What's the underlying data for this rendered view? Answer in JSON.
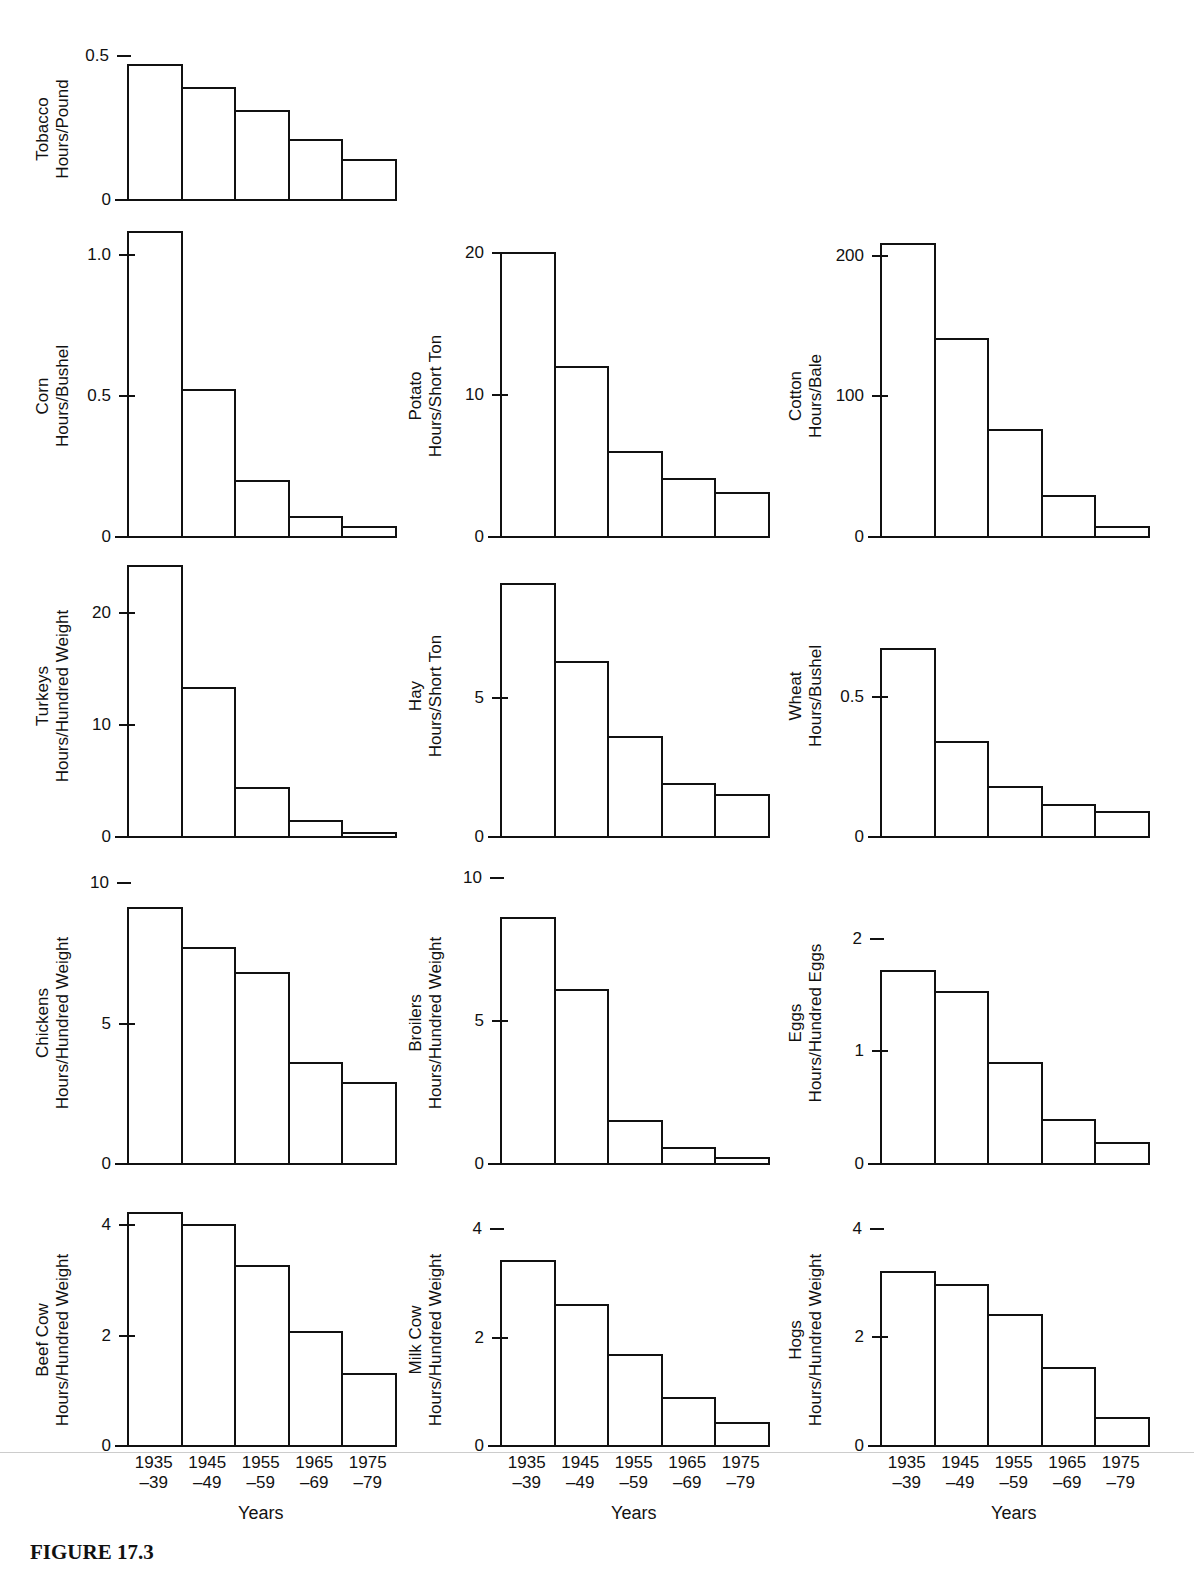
{
  "figure": {
    "caption": "FIGURE 17.3",
    "x_axis_title": "Years"
  },
  "categories": [
    "1935\n–39",
    "1945\n–49",
    "1955\n–59",
    "1965\n–69",
    "1975\n–79"
  ],
  "category_lines": [
    [
      "1935",
      "–39"
    ],
    [
      "1945",
      "–49"
    ],
    [
      "1955",
      "–59"
    ],
    [
      "1965",
      "–69"
    ],
    [
      "1975",
      "–79"
    ]
  ],
  "chart_data": [
    {
      "type": "bar",
      "title": "Tobacco",
      "ylabel": "Tobacco Hours/Pound",
      "xlabel": "",
      "categories": [
        "1935–39",
        "1945–49",
        "1955–59",
        "1965–69",
        "1975–79"
      ],
      "values": [
        0.47,
        0.39,
        0.31,
        0.21,
        0.14
      ],
      "yticks": [
        "0",
        "0.5"
      ],
      "ylim": [
        0,
        0.5
      ]
    },
    {
      "type": "bar",
      "title": "Corn",
      "ylabel": "Corn Hours/Bushel",
      "xlabel": "",
      "categories": [
        "1935–39",
        "1945–49",
        "1955–59",
        "1965–69",
        "1975–79"
      ],
      "values": [
        1.08,
        0.52,
        0.2,
        0.07,
        0.035
      ],
      "yticks": [
        "0",
        "0.5",
        "1.0"
      ],
      "ylim": [
        0,
        1.1
      ]
    },
    {
      "type": "bar",
      "title": "Potato",
      "ylabel": "Potato Hours/Short Ton",
      "xlabel": "",
      "categories": [
        "1935–39",
        "1945–49",
        "1955–59",
        "1965–69",
        "1975–79"
      ],
      "values": [
        20,
        12,
        6,
        4.1,
        3.1
      ],
      "yticks": [
        "0",
        "10",
        "20"
      ],
      "ylim": [
        0,
        20
      ]
    },
    {
      "type": "bar",
      "title": "Cotton",
      "ylabel": "Cotton Hours/Bale",
      "xlabel": "",
      "categories": [
        "1935–39",
        "1945–49",
        "1955–59",
        "1965–69",
        "1975–79"
      ],
      "values": [
        208,
        141,
        76,
        29,
        7
      ],
      "yticks": [
        "0",
        "100",
        "200"
      ],
      "ylim": [
        0,
        210
      ]
    },
    {
      "type": "bar",
      "title": "Turkeys",
      "ylabel": "Turkeys Hours/Hundred Weight",
      "xlabel": "",
      "categories": [
        "1935–39",
        "1945–49",
        "1955–59",
        "1965–69",
        "1975–79"
      ],
      "values": [
        24.2,
        13.3,
        4.4,
        1.4,
        0.4
      ],
      "yticks": [
        "0",
        "10",
        "20"
      ],
      "ylim": [
        0,
        24.5
      ]
    },
    {
      "type": "bar",
      "title": "Hay",
      "ylabel": "Hay Hours/Short Ton",
      "xlabel": "",
      "categories": [
        "1935–39",
        "1945–49",
        "1955–59",
        "1965–69",
        "1975–79"
      ],
      "values": [
        9.1,
        6.3,
        3.6,
        1.9,
        1.5
      ],
      "yticks": [
        "0",
        "5"
      ],
      "ylim": [
        0,
        9.2
      ]
    },
    {
      "type": "bar",
      "title": "Wheat",
      "ylabel": "Wheat Hours/Bushel",
      "xlabel": "",
      "categories": [
        "1935–39",
        "1945–49",
        "1955–59",
        "1965–69",
        "1975–79"
      ],
      "values": [
        0.67,
        0.34,
        0.18,
        0.115,
        0.09
      ],
      "yticks": [
        "0",
        "0.5"
      ],
      "ylim": [
        0,
        0.7
      ]
    },
    {
      "type": "bar",
      "title": "Chickens",
      "ylabel": "Chickens Hours/Hundred Weight",
      "xlabel": "",
      "categories": [
        "1935–39",
        "1945–49",
        "1955–59",
        "1965–69",
        "1975–79"
      ],
      "values": [
        9.1,
        7.7,
        6.8,
        3.6,
        2.9
      ],
      "yticks": [
        "0",
        "5",
        "10"
      ],
      "ylim": [
        0,
        10
      ]
    },
    {
      "type": "bar",
      "title": "Broilers",
      "ylabel": "Broilers Hours/Hundred Weight",
      "xlabel": "",
      "categories": [
        "1935–39",
        "1945–49",
        "1955–59",
        "1965–69",
        "1975–79"
      ],
      "values": [
        8.6,
        6.1,
        1.5,
        0.55,
        0.22
      ],
      "yticks": [
        "0",
        "5",
        "10"
      ],
      "ylim": [
        0,
        10
      ]
    },
    {
      "type": "bar",
      "title": "Eggs",
      "ylabel": "Eggs Hours/Hundred Eggs",
      "xlabel": "",
      "categories": [
        "1935–39",
        "1945–49",
        "1955–59",
        "1965–69",
        "1975–79"
      ],
      "values": [
        1.71,
        1.53,
        0.9,
        0.39,
        0.19
      ],
      "yticks": [
        "0",
        "1",
        "2"
      ],
      "ylim": [
        0,
        2
      ]
    },
    {
      "type": "bar",
      "title": "Beef Cow",
      "ylabel": "Beef Cow Hours/Hundred Weight",
      "xlabel": "Years",
      "categories": [
        "1935–39",
        "1945–49",
        "1955–59",
        "1965–69",
        "1975–79"
      ],
      "values": [
        4.23,
        4.0,
        3.26,
        2.07,
        1.31
      ],
      "yticks": [
        "0",
        "2",
        "4"
      ],
      "ylim": [
        0,
        4.3
      ]
    },
    {
      "type": "bar",
      "title": "Milk Cow",
      "ylabel": "Milk Cow Hours/Hundred Weight",
      "xlabel": "Years",
      "categories": [
        "1935–39",
        "1945–49",
        "1955–59",
        "1965–69",
        "1975–79"
      ],
      "values": [
        3.41,
        2.6,
        1.67,
        0.89,
        0.42
      ],
      "yticks": [
        "0",
        "2",
        "4"
      ],
      "ylim": [
        0,
        4
      ]
    },
    {
      "type": "bar",
      "title": "Hogs",
      "ylabel": "Hogs Hours/Hundred Weight",
      "xlabel": "Years",
      "categories": [
        "1935–39",
        "1945–49",
        "1955–59",
        "1965–69",
        "1975–79"
      ],
      "values": [
        3.21,
        2.97,
        2.42,
        1.43,
        0.52
      ],
      "yticks": [
        "0",
        "2",
        "4"
      ],
      "ylim": [
        0,
        4
      ]
    }
  ],
  "layout": [
    {
      "x": 127,
      "base": 199,
      "pxPerUnit": 288,
      "ticks": [
        [
          0,
          "0"
        ],
        [
          0.5,
          "0.5"
        ]
      ],
      "tickStyle": [
        "in",
        "dash"
      ],
      "label": [
        "Tobacco",
        "Hours/Pound"
      ]
    },
    {
      "x": 127,
      "base": 536,
      "pxPerUnit": 282,
      "ticks": [
        [
          0,
          "0"
        ],
        [
          0.5,
          "0.5"
        ],
        [
          1.0,
          "1.0"
        ]
      ],
      "tickStyle": [
        "in",
        "in",
        "in"
      ],
      "label": [
        "Corn",
        "Hours/Bushel"
      ]
    },
    {
      "x": 500,
      "base": 536,
      "pxPerUnit": 14.2,
      "ticks": [
        [
          0,
          "0"
        ],
        [
          10,
          "10"
        ],
        [
          20,
          "20"
        ]
      ],
      "tickStyle": [
        "in",
        "in",
        "in"
      ],
      "label": [
        "Potato",
        "Hours/Short Ton"
      ]
    },
    {
      "x": 880,
      "base": 536,
      "pxPerUnit": 1.407,
      "ticks": [
        [
          0,
          "0"
        ],
        [
          100,
          "100"
        ],
        [
          200,
          "200"
        ]
      ],
      "tickStyle": [
        "in",
        "in",
        "in"
      ],
      "label": [
        "Cotton",
        "Hours/Bale"
      ]
    },
    {
      "x": 127,
      "base": 836,
      "pxPerUnit": 11.2,
      "ticks": [
        [
          0,
          "0"
        ],
        [
          10,
          "10"
        ],
        [
          20,
          "20"
        ]
      ],
      "tickStyle": [
        "in",
        "in",
        "in"
      ],
      "label": [
        "Turkeys",
        "Hours/Hundred Weight"
      ]
    },
    {
      "x": 500,
      "base": 836,
      "pxPerUnit": 27.8,
      "ticks": [
        [
          0,
          "0"
        ],
        [
          5,
          "5"
        ]
      ],
      "tickStyle": [
        "in",
        "in"
      ],
      "label": [
        "Hay",
        "Hours/Short Ton"
      ]
    },
    {
      "x": 880,
      "base": 836,
      "pxPerUnit": 280,
      "ticks": [
        [
          0,
          "0"
        ],
        [
          0.5,
          "0.5"
        ]
      ],
      "tickStyle": [
        "in",
        "in"
      ],
      "label": [
        "Wheat",
        "Hours/Bushel"
      ]
    },
    {
      "x": 127,
      "base": 1163,
      "pxPerUnit": 28.1,
      "ticks": [
        [
          0,
          "0"
        ],
        [
          5,
          "5"
        ],
        [
          10,
          "10"
        ]
      ],
      "tickStyle": [
        "in",
        "in",
        "dash"
      ],
      "label": [
        "Chickens",
        "Hours/Hundred Weight"
      ]
    },
    {
      "x": 500,
      "base": 1163,
      "pxPerUnit": 28.6,
      "ticks": [
        [
          0,
          "0"
        ],
        [
          5,
          "5"
        ],
        [
          10,
          "10"
        ]
      ],
      "tickStyle": [
        "in",
        "in",
        "dash"
      ],
      "label": [
        "Broilers",
        "Hours/Hundred Weight"
      ]
    },
    {
      "x": 880,
      "base": 1163,
      "pxPerUnit": 112.7,
      "ticks": [
        [
          0,
          "0"
        ],
        [
          1,
          "1"
        ],
        [
          2,
          "2"
        ]
      ],
      "tickStyle": [
        "in",
        "in",
        "dash"
      ],
      "label": [
        "Eggs",
        "Hours/Hundred Eggs"
      ]
    },
    {
      "x": 127,
      "base": 1445,
      "pxPerUnit": 55.2,
      "ticks": [
        [
          0,
          "0"
        ],
        [
          2,
          "2"
        ],
        [
          4,
          "4"
        ]
      ],
      "tickStyle": [
        "in",
        "in",
        "in"
      ],
      "label": [
        "Beef Cow",
        "Hours/Hundred Weight"
      ]
    },
    {
      "x": 500,
      "base": 1445,
      "pxPerUnit": 54.2,
      "ticks": [
        [
          0,
          "0"
        ],
        [
          2,
          "2"
        ],
        [
          4,
          "4"
        ]
      ],
      "tickStyle": [
        "in",
        "in",
        "dash"
      ],
      "label": [
        "Milk Cow",
        "Hours/Hundred Weight"
      ]
    },
    {
      "x": 880,
      "base": 1445,
      "pxPerUnit": 54.3,
      "ticks": [
        [
          0,
          "0"
        ],
        [
          2,
          "2"
        ],
        [
          4,
          "4"
        ]
      ],
      "tickStyle": [
        "in",
        "in",
        "dash"
      ],
      "label": [
        "Hogs",
        "Hours/Hundred Weight"
      ]
    }
  ]
}
